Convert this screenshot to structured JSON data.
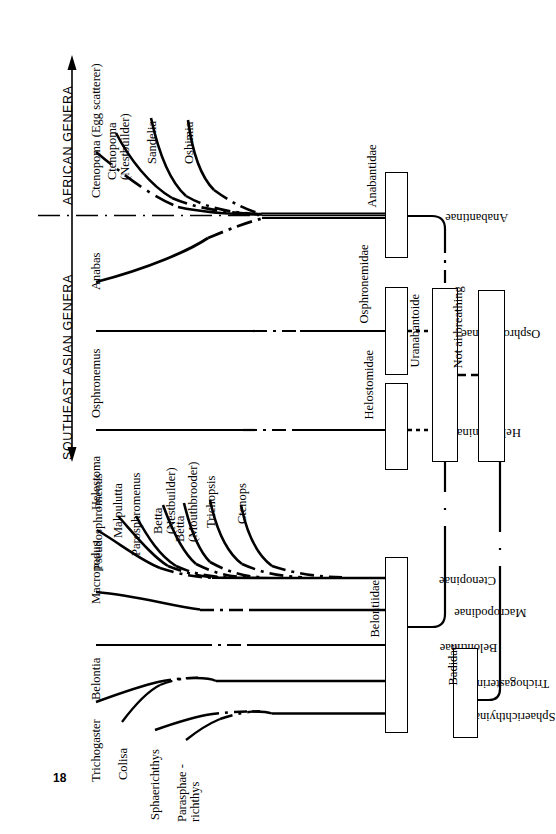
{
  "figure": {
    "type": "phylogenetic-cladogram",
    "page_number": "18",
    "axes": [
      {
        "id": "african",
        "label": "AFRICAN  GENERA",
        "arrow": "up"
      },
      {
        "id": "southeast-asian",
        "label": "SOUTHEAST  ASIAN  GENERA",
        "arrow": "down"
      }
    ],
    "genera": [
      {
        "id": "ctenopoma-egg",
        "label": "Ctenopoma (Egg scatterer)",
        "group": "african"
      },
      {
        "id": "ctenopoma-nest",
        "label": "Ctenopoma\n(Nestbuilder)",
        "group": "african"
      },
      {
        "id": "sandelia",
        "label": "Sandelia",
        "group": "african"
      },
      {
        "id": "oshimia",
        "label": "Oshimia",
        "group": "african"
      },
      {
        "id": "anabas",
        "label": "Anabas",
        "group": "southeast-asian"
      },
      {
        "id": "osphronemus",
        "label": "Osphronemus",
        "group": "southeast-asian"
      },
      {
        "id": "helostoma",
        "label": "Helostoma",
        "group": "southeast-asian"
      },
      {
        "id": "pseudosphromenus",
        "label": "Pseudosphromenus",
        "group": "southeast-asian"
      },
      {
        "id": "malpulutta",
        "label": "Malpulutta",
        "group": "southeast-asian"
      },
      {
        "id": "parosphromenus",
        "label": "Parosphromenus",
        "group": "southeast-asian"
      },
      {
        "id": "betta-nest",
        "label": "Betta\n(Nestbuilder)",
        "group": "southeast-asian"
      },
      {
        "id": "betta-mouth",
        "label": "Betta\n(Mouthbrooder)",
        "group": "southeast-asian"
      },
      {
        "id": "trichopsis",
        "label": "Trichopsis",
        "group": "southeast-asian"
      },
      {
        "id": "ctenops",
        "label": "Ctenops",
        "group": "southeast-asian"
      },
      {
        "id": "macropodus",
        "label": "Macropodus",
        "group": "southeast-asian"
      },
      {
        "id": "belontia",
        "label": "Belontia",
        "group": "southeast-asian"
      },
      {
        "id": "trichogaster",
        "label": "Trichogaster",
        "group": "southeast-asian"
      },
      {
        "id": "colisa",
        "label": "Colisa",
        "group": "southeast-asian"
      },
      {
        "id": "sphaerichthys",
        "label": "Sphaerichthys",
        "group": "southeast-asian"
      },
      {
        "id": "parasphaerichthys",
        "label": "Parasphae -\nrichthys",
        "group": "southeast-asian"
      }
    ],
    "subfamilies": [
      {
        "id": "anabantinae",
        "label": "Anabantinae"
      },
      {
        "id": "osphroneminae",
        "label": "Osphroneminae"
      },
      {
        "id": "helostominae",
        "label": "Helostominae"
      },
      {
        "id": "ctenopinae",
        "label": "Ctenopinae"
      },
      {
        "id": "macropodinae",
        "label": "Macropodinae"
      },
      {
        "id": "belontiinae",
        "label": "Belontiinae"
      },
      {
        "id": "trichogasterinae",
        "label": "Trichogasterinae"
      },
      {
        "id": "sphaerichthyinae",
        "label": "Sphaerichthyinae"
      }
    ],
    "families": [
      {
        "id": "anabantidae",
        "label": "Anabantidae"
      },
      {
        "id": "osphronemidae",
        "label": "Osphronemidae"
      },
      {
        "id": "helostomidae",
        "label": "Helostomidae"
      },
      {
        "id": "belontiidae",
        "label": "Belontiidae"
      },
      {
        "id": "badidae",
        "label": "Badidae"
      }
    ],
    "superboxes": [
      {
        "id": "uranabantoide",
        "label": "Uranabantoide"
      },
      {
        "id": "not-airbreathing",
        "label": "Not airbreathing"
      }
    ],
    "colors": {
      "ink": "#000000",
      "paper": "#ffffff"
    }
  }
}
